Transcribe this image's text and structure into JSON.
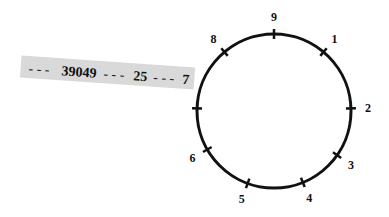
{
  "diagram": {
    "type": "circular-dial",
    "circle": {
      "cx": 274,
      "cy": 111,
      "r": 77,
      "stroke": "#111111",
      "stroke_width": 3
    },
    "markers": [
      {
        "label": "9",
        "angle_deg": 0
      },
      {
        "label": "1",
        "angle_deg": 40
      },
      {
        "label": "2",
        "angle_deg": 88
      },
      {
        "label": "3",
        "angle_deg": 125
      },
      {
        "label": "4",
        "angle_deg": 158
      },
      {
        "label": "5",
        "angle_deg": 200
      },
      {
        "label": "6",
        "angle_deg": 240
      },
      {
        "label": "7",
        "angle_deg": 272
      },
      {
        "label": "8",
        "angle_deg": 320
      }
    ],
    "pointer_strip": {
      "text_parts": [
        "- - -",
        "39049",
        "- - -",
        "25",
        "- - -",
        "7"
      ],
      "background": "#d9d9d9",
      "rotation_deg": 4
    }
  }
}
